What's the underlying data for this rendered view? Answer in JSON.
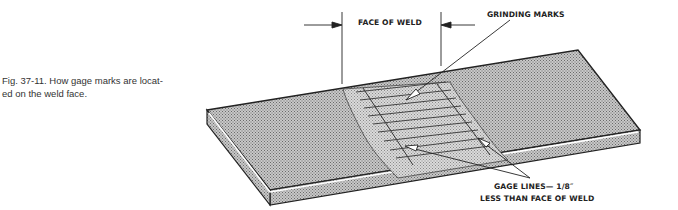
{
  "figure": {
    "caption": "Fig. 37-11. How gage marks are located on the weld face.",
    "caption_line1": "Fig. 37-11.  How gage marks are locat-",
    "caption_line2": "ed on the weld face."
  },
  "labels": {
    "face_of_weld": "FACE OF WELD",
    "grinding_marks": "GRINDING MARKS",
    "gage_lines_line1": "GAGE LINES— 1/8″",
    "gage_lines_line2": "LESS THAN FACE OF WELD"
  },
  "colors": {
    "ink": "#222222",
    "plate_fill": "#b8b8b8",
    "weld_fill": "#cfcfcf",
    "background": "#ffffff"
  }
}
